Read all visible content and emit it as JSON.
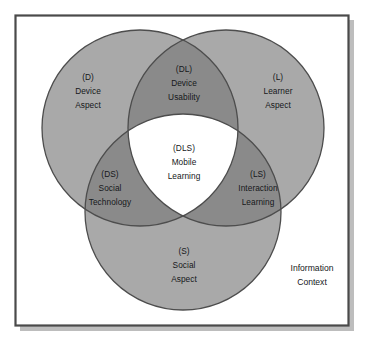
{
  "figure": {
    "frame": {
      "border_color": "#4a4a4a",
      "background_color": "#ffffff",
      "shadow_color": "#b9b9b9"
    },
    "palette": {
      "circle_fill": "#a9a9a9",
      "overlap_fill": "#8a8a8a",
      "center_fill": "#ffffff",
      "stroke": "#4d4d4d",
      "text": "#16181a"
    }
  },
  "regions": {
    "device": {
      "code": "(D)",
      "line1": "Device",
      "line2": "Aspect"
    },
    "device_usability": {
      "code": "(DL)",
      "line1": "Device",
      "line2": "Usability"
    },
    "learner": {
      "code": "(L)",
      "line1": "Learner",
      "line2": "Aspect"
    },
    "social_technology": {
      "code": "(DS)",
      "line1": "Social",
      "line2": "Technology"
    },
    "mobile_learning": {
      "code": "(DLS)",
      "line1": "Mobile",
      "line2": "Learning"
    },
    "interaction_learning": {
      "code": "(LS)",
      "line1": "Interaction",
      "line2": "Learning"
    },
    "social": {
      "code": "(S)",
      "line1": "Social",
      "line2": "Aspect"
    }
  },
  "outside": {
    "information_context": {
      "line1": "Information",
      "line2": "Context"
    }
  }
}
